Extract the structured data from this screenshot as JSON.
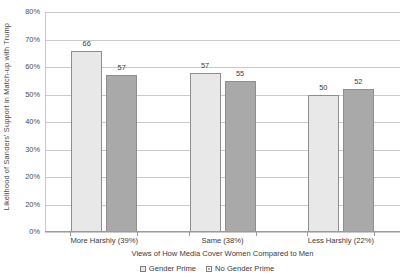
{
  "chart_data": {
    "type": "bar",
    "title": "",
    "subtitle": "",
    "xlabel": "Views of How Media Cover Women Compared to Men",
    "ylabel": "Likelihood of Sanders' Support in Match-up with Trump",
    "categories": [
      "More Harshly (39%)",
      "Same (38%)",
      "Less Harshly (22%)"
    ],
    "series": [
      {
        "name": "Gender Prime",
        "values": [
          66,
          57,
          50
        ],
        "color": "#e8e8e8"
      },
      {
        "name": "No Gender Prime",
        "values": [
          57,
          55,
          52
        ],
        "color": "#a9a9a9"
      }
    ],
    "series_display": [
      {
        "name": "Gender Prime",
        "values": [
          66,
          58,
          50
        ],
        "color": "#e8e8e8"
      },
      {
        "name": "No Gender Prime",
        "values": [
          57,
          55,
          52
        ],
        "color": "#a9a9a9"
      }
    ],
    "ylim": [
      0,
      80
    ],
    "ytick_values": [
      0,
      10,
      20,
      30,
      40,
      50,
      60,
      70,
      80
    ],
    "ytick_labels": [
      "0%",
      "20%",
      "20%",
      "30%",
      "40%",
      "50%",
      "60%",
      "70%",
      "80%"
    ],
    "grid": true,
    "legend_position": "bottom",
    "bar_border_color": "#8e8e8e",
    "gridline_color": "#c9c9c9",
    "axis_color": "#9a9a9a"
  },
  "axis": {
    "y_title": "Likelihood of Sanders' Support in Match-up with Trump",
    "x_title": "Views of How Media Cover Women Compared to Men"
  },
  "legend": {
    "items": [
      {
        "label": "Gender Prime"
      },
      {
        "label": "No Gender Prime"
      }
    ]
  }
}
